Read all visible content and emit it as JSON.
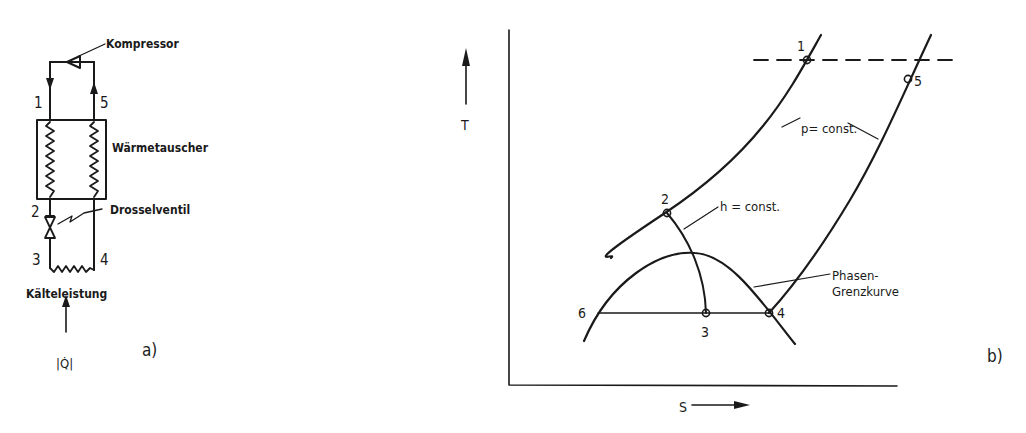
{
  "panel_a": {
    "caption": "a)",
    "labels": {
      "compressor": "Kompressor",
      "heat_exchanger": "Wärmetauscher",
      "throttle_valve": "Drosselventil",
      "cooling_capacity": "Kälteleistung",
      "heat_flow": "|Q̇|"
    },
    "state_points": [
      "1",
      "2",
      "3",
      "4",
      "5"
    ]
  },
  "panel_b": {
    "caption": "b)",
    "axes": {
      "y_label": "T",
      "x_label": "S"
    },
    "labels": {
      "isobar": "p= const.",
      "isenthalp": "h = const.",
      "phase_boundary_line1": "Phasen-",
      "phase_boundary_line2": "Grenzkurve"
    },
    "state_points": [
      "1",
      "2",
      "3",
      "4",
      "5",
      "6"
    ]
  },
  "colors": {
    "ink": "#1a1a1a",
    "paper": "#ffffff"
  }
}
